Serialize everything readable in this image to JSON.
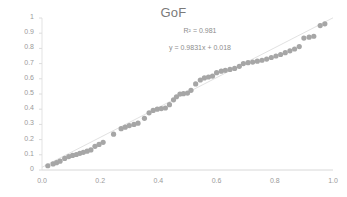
{
  "chart_data": {
    "type": "scatter",
    "title": "GoF",
    "xlabel": "",
    "ylabel": "",
    "xlim": [
      0.0,
      1.0
    ],
    "ylim": [
      0,
      1
    ],
    "grid": false,
    "legend": "none",
    "xticks": [
      "0.0",
      "0.2",
      "0.4",
      "0.6",
      "0.8",
      "1.0"
    ],
    "xtick_values": [
      0.0,
      0.2,
      0.4,
      0.6,
      0.8,
      1.0
    ],
    "yticks": [
      "0",
      "0.1",
      "0.2",
      "0.3",
      "0.4",
      "0.5",
      "0.6",
      "0.7",
      "0.8",
      "0.9",
      "1"
    ],
    "ytick_values": [
      0,
      0.1,
      0.2,
      0.3,
      0.4,
      0.5,
      0.6,
      0.7,
      0.8,
      0.9,
      1
    ],
    "annotations": [
      {
        "name": "r-squared",
        "text": "R² = 0.981"
      },
      {
        "name": "regression-equation",
        "text": "y = 0.9831x + 0.018"
      }
    ],
    "trendline": {
      "slope": 0.9831,
      "intercept": 0.018,
      "r_squared": 0.981,
      "color": "#d9d9d9"
    },
    "marker": {
      "color": "#a6a6a6",
      "size": 2.6,
      "shape": "circle"
    },
    "series": [
      {
        "name": "GoF",
        "x": [
          0.02,
          0.038,
          0.05,
          0.062,
          0.078,
          0.092,
          0.105,
          0.118,
          0.13,
          0.142,
          0.155,
          0.168,
          0.182,
          0.196,
          0.21,
          0.246,
          0.272,
          0.286,
          0.3,
          0.316,
          0.33,
          0.352,
          0.368,
          0.382,
          0.396,
          0.41,
          0.424,
          0.438,
          0.452,
          0.462,
          0.474,
          0.486,
          0.5,
          0.512,
          0.528,
          0.544,
          0.558,
          0.572,
          0.586,
          0.6,
          0.616,
          0.63,
          0.646,
          0.662,
          0.678,
          0.692,
          0.708,
          0.724,
          0.74,
          0.756,
          0.772,
          0.788,
          0.804,
          0.82,
          0.836,
          0.852,
          0.868,
          0.884,
          0.9,
          0.918,
          0.934,
          0.956,
          0.972
        ],
        "y": [
          0.028,
          0.04,
          0.048,
          0.058,
          0.076,
          0.088,
          0.096,
          0.102,
          0.11,
          0.116,
          0.124,
          0.132,
          0.156,
          0.168,
          0.182,
          0.236,
          0.272,
          0.282,
          0.292,
          0.3,
          0.308,
          0.34,
          0.376,
          0.392,
          0.4,
          0.404,
          0.408,
          0.43,
          0.462,
          0.482,
          0.5,
          0.502,
          0.506,
          0.524,
          0.566,
          0.592,
          0.606,
          0.612,
          0.618,
          0.64,
          0.65,
          0.656,
          0.662,
          0.668,
          0.682,
          0.7,
          0.706,
          0.71,
          0.716,
          0.722,
          0.73,
          0.74,
          0.75,
          0.76,
          0.772,
          0.784,
          0.796,
          0.812,
          0.868,
          0.874,
          0.88,
          0.95,
          0.962
        ]
      }
    ]
  }
}
